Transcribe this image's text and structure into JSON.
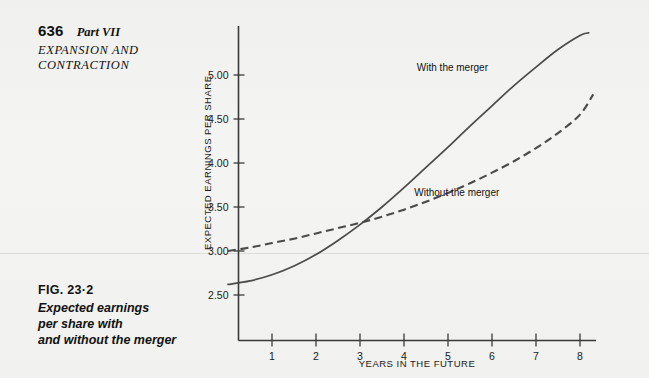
{
  "running_head": {
    "page_number": "636",
    "part": "Part VII",
    "section_title_line1": "EXPANSION AND",
    "section_title_line2": "CONTRACTION"
  },
  "caption": {
    "figure_label": "FIG. 23·2",
    "line1": "Expected earnings",
    "line2": "per share with",
    "line3": "and without the merger"
  },
  "chart_data": {
    "type": "line",
    "title": "Expected earnings per share with and without the merger",
    "xlabel": "YEARS IN THE FUTURE",
    "ylabel": "EXPECTED EARNINGS PER SHARE",
    "xlim": [
      0,
      8.5
    ],
    "ylim": [
      2.28,
      5.6
    ],
    "xticks": [
      1,
      2,
      3,
      4,
      5,
      6,
      7,
      8
    ],
    "xtick_labels": [
      "1",
      "2",
      "3",
      "4",
      "5",
      "6",
      "7",
      "8"
    ],
    "yticks": [
      2.5,
      3.0,
      3.5,
      4.0,
      4.5,
      5.0
    ],
    "ytick_labels": [
      "2.50",
      "3.00",
      "3.50",
      "4.00",
      "4.50",
      "5.00"
    ],
    "grid": false,
    "legend_position": "inline-annotations",
    "crossover": {
      "x": 3.2,
      "y": 3.33
    },
    "series": [
      {
        "name": "With the merger",
        "style": "solid",
        "label_x": 5.1,
        "label_y": 5.05,
        "x": [
          0.0,
          0.5,
          1.0,
          1.5,
          2.0,
          2.5,
          3.0,
          3.5,
          4.0,
          4.5,
          5.0,
          5.5,
          6.0,
          6.5,
          7.0,
          7.5,
          8.0,
          8.2
        ],
        "values": [
          2.62,
          2.66,
          2.73,
          2.83,
          2.96,
          3.12,
          3.3,
          3.5,
          3.72,
          3.95,
          4.18,
          4.42,
          4.65,
          4.88,
          5.09,
          5.29,
          5.45,
          5.48
        ]
      },
      {
        "name": "Without the merger",
        "style": "dashed",
        "label_x": 5.2,
        "label_y": 3.62,
        "x": [
          0.0,
          0.5,
          1.0,
          1.5,
          2.0,
          2.5,
          3.0,
          3.5,
          4.0,
          4.5,
          5.0,
          5.5,
          6.0,
          6.5,
          7.0,
          7.5,
          8.0,
          8.3
        ],
        "values": [
          3.0,
          3.04,
          3.09,
          3.14,
          3.2,
          3.26,
          3.32,
          3.39,
          3.47,
          3.56,
          3.66,
          3.77,
          3.89,
          4.02,
          4.17,
          4.34,
          4.55,
          4.78
        ]
      }
    ]
  },
  "colors": {
    "paper": "#f2f2f0",
    "ink": "#1a1a1a",
    "curve": "#4a4a4a",
    "axis": "#3a3a3a"
  }
}
